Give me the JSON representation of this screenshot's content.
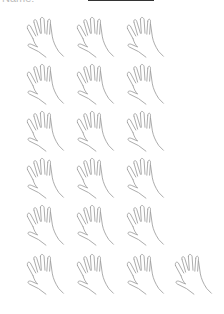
{
  "worksheet": {
    "header_label": "Name:",
    "name_line_value": "",
    "stroke_color": "#9a9a9a"
  },
  "hands": {
    "count": 22,
    "rows": [
      {
        "row": 1,
        "count": 3
      },
      {
        "row": 2,
        "count": 3
      },
      {
        "row": 3,
        "count": 3
      },
      {
        "row": 4,
        "count": 3
      },
      {
        "row": 5,
        "count": 3
      },
      {
        "row": 6,
        "count": 4
      }
    ]
  }
}
